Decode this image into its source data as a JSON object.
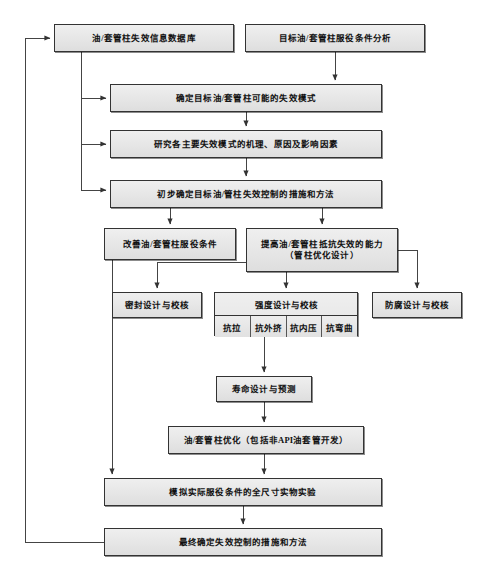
{
  "diagram": {
    "style": {
      "node_fill": "#e8e8e8",
      "node_border": "#333333",
      "edge_color": "#444444",
      "background": "#ffffff"
    },
    "nodes": [
      {
        "id": "db",
        "label": "油/套管柱失效信息数据库",
        "x": 54,
        "y": 24,
        "w": 180,
        "h": 28
      },
      {
        "id": "cond",
        "label": "目标油/套管柱服役条件分析",
        "x": 245,
        "y": 24,
        "w": 180,
        "h": 28
      },
      {
        "id": "modes",
        "label": "确定目标油/套管柱可能的失效模式",
        "x": 110,
        "y": 84,
        "w": 272,
        "h": 28
      },
      {
        "id": "mechanism",
        "label": "研究各主要失效模式的机理、原因及影响因素",
        "x": 110,
        "y": 130,
        "w": 272,
        "h": 28
      },
      {
        "id": "prelim",
        "label": "初步确定目标油/管柱失效控制的措施和方法",
        "x": 110,
        "y": 180,
        "w": 272,
        "h": 28
      },
      {
        "id": "improve",
        "label": "改善油/套管柱服役条件",
        "x": 104,
        "y": 228,
        "w": 132,
        "h": 32
      },
      {
        "id": "resist",
        "label": "提高油/套管柱抵抗失效的能力\n（管柱优化设计）",
        "x": 246,
        "y": 228,
        "w": 152,
        "h": 44
      },
      {
        "id": "seal",
        "label": "密封设计与校核",
        "x": 112,
        "y": 292,
        "w": 90,
        "h": 26
      },
      {
        "id": "corrosion",
        "label": "防腐设计与校核",
        "x": 372,
        "y": 292,
        "w": 90,
        "h": 26
      },
      {
        "id": "life",
        "label": "寿命设计与预测",
        "x": 216,
        "y": 376,
        "w": 96,
        "h": 26
      },
      {
        "id": "optimize",
        "label": "油/套管柱优化（包括非API油套管开发）",
        "x": 168,
        "y": 426,
        "w": 196,
        "h": 28
      },
      {
        "id": "fullscale",
        "label": "模拟实际服役条件的全尺寸实物实验",
        "x": 104,
        "y": 478,
        "w": 278,
        "h": 28
      },
      {
        "id": "final",
        "label": "最终确定失效控制的措施和方法",
        "x": 104,
        "y": 528,
        "w": 278,
        "h": 28
      }
    ],
    "strength_group": {
      "id": "strength",
      "header": "强度设计与校核",
      "x": 214,
      "y": 292,
      "w": 144,
      "h": 44,
      "cells": [
        "抗拉",
        "抗外挤",
        "抗内压",
        "抗弯曲"
      ]
    },
    "edges": [
      {
        "name": "cond-to-modes",
        "from": "cond",
        "to": "modes"
      },
      {
        "name": "db-to-modes",
        "from": "db",
        "to": "modes"
      },
      {
        "name": "db-to-mechanism",
        "from": "db",
        "to": "mechanism"
      },
      {
        "name": "db-to-prelim",
        "from": "db",
        "to": "prelim"
      },
      {
        "name": "modes-to-mechanism",
        "from": "modes",
        "to": "mechanism"
      },
      {
        "name": "mechanism-to-prelim",
        "from": "mechanism",
        "to": "prelim"
      },
      {
        "name": "prelim-to-improve",
        "from": "prelim",
        "to": "improve"
      },
      {
        "name": "prelim-to-resist",
        "from": "prelim",
        "to": "resist"
      },
      {
        "name": "resist-to-seal",
        "from": "resist",
        "to": "seal"
      },
      {
        "name": "resist-to-strength",
        "from": "resist",
        "to": "strength"
      },
      {
        "name": "resist-to-corrosion",
        "from": "resist",
        "to": "corrosion"
      },
      {
        "name": "strength-to-life",
        "from": "strength",
        "to": "life"
      },
      {
        "name": "life-to-optimize",
        "from": "life",
        "to": "optimize"
      },
      {
        "name": "optimize-to-fullscale",
        "from": "optimize",
        "to": "fullscale"
      },
      {
        "name": "improve-to-fullscale",
        "from": "improve",
        "to": "fullscale"
      },
      {
        "name": "fullscale-to-final",
        "from": "fullscale",
        "to": "final"
      },
      {
        "name": "final-feedback-to-db",
        "from": "final",
        "to": "db"
      }
    ]
  }
}
